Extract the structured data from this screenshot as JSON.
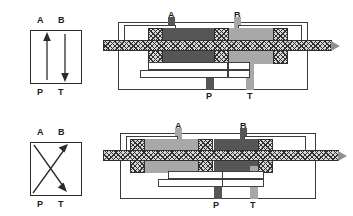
{
  "figure": {
    "kind": "hydraulic-valve-cross-section"
  },
  "ports": {
    "a": "A",
    "b": "B",
    "p": "P",
    "t": "T"
  },
  "colors": {
    "pressure_fill": "#565656",
    "return_fill": "#a8a8a8",
    "hatch_line": "#2f2f2f",
    "outline": "#3a3a3a",
    "label_text": "#1d1d1d"
  },
  "panels": [
    {
      "id": "symbol-parallel",
      "name": "Parallel flow symbol",
      "flow_paths": [
        "P to A",
        "B to T"
      ],
      "arrows": [
        {
          "from": "P",
          "to": "A",
          "direction": "up"
        },
        {
          "from": "B",
          "to": "T",
          "direction": "down"
        }
      ],
      "top_labels": [
        "A",
        "B"
      ],
      "bottom_labels": [
        "P",
        "T"
      ]
    },
    {
      "id": "symbol-crossed",
      "name": "Crossed flow symbol",
      "flow_paths": [
        "P to B",
        "A to T"
      ],
      "arrows": [
        {
          "from": "P",
          "to": "B",
          "direction": "up-right"
        },
        {
          "from": "A",
          "to": "T",
          "direction": "down-right"
        }
      ],
      "top_labels": [
        "A",
        "B"
      ],
      "bottom_labels": [
        "P",
        "T"
      ]
    },
    {
      "id": "section-position-1",
      "name": "Spool shifted left: P connects A, B connects T",
      "top_labels": [
        "A",
        "B"
      ],
      "bottom_labels": [
        "P",
        "T"
      ],
      "pressure_region": "left-center",
      "return_region": "right"
    },
    {
      "id": "section-position-2",
      "name": "Spool shifted right: P connects B, A connects T",
      "top_labels": [
        "A",
        "B"
      ],
      "bottom_labels": [
        "P",
        "T"
      ],
      "pressure_region": "center-right",
      "return_region": "left"
    }
  ]
}
